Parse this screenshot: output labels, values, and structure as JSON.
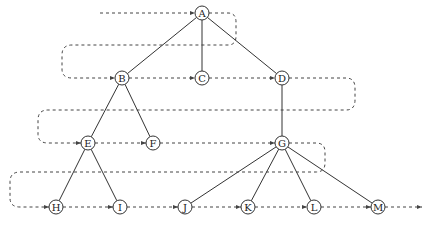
{
  "diagram": {
    "type": "tree-level-order-traversal",
    "colors": {
      "edge": "#333333",
      "path": "#444444",
      "node_stroke": "#333333",
      "node_fill": "#ffffff",
      "label": "#222222"
    },
    "node_radius": 7,
    "nodes": [
      {
        "id": "A",
        "label": "A",
        "x": 202,
        "y": 13
      },
      {
        "id": "B",
        "label": "B",
        "x": 122,
        "y": 78
      },
      {
        "id": "C",
        "label": "C",
        "x": 202,
        "y": 78
      },
      {
        "id": "D",
        "label": "D",
        "x": 282,
        "y": 78
      },
      {
        "id": "E",
        "label": "E",
        "x": 88,
        "y": 143
      },
      {
        "id": "F",
        "label": "F",
        "x": 153,
        "y": 143
      },
      {
        "id": "G",
        "label": "G",
        "x": 282,
        "y": 143
      },
      {
        "id": "H",
        "label": "H",
        "x": 56,
        "y": 207
      },
      {
        "id": "I",
        "label": "I",
        "x": 120,
        "y": 207
      },
      {
        "id": "J",
        "label": "J",
        "x": 185,
        "y": 207
      },
      {
        "id": "K",
        "label": "K",
        "x": 248,
        "y": 207
      },
      {
        "id": "L",
        "label": "L",
        "x": 314,
        "y": 207
      },
      {
        "id": "M",
        "label": "M",
        "x": 378,
        "y": 207
      }
    ],
    "edges": [
      [
        "A",
        "B"
      ],
      [
        "A",
        "C"
      ],
      [
        "A",
        "D"
      ],
      [
        "B",
        "E"
      ],
      [
        "B",
        "F"
      ],
      [
        "D",
        "G"
      ],
      [
        "E",
        "H"
      ],
      [
        "E",
        "I"
      ],
      [
        "G",
        "J"
      ],
      [
        "G",
        "K"
      ],
      [
        "G",
        "L"
      ],
      [
        "G",
        "M"
      ]
    ],
    "traversal_order": [
      "A",
      "B",
      "C",
      "D",
      "E",
      "F",
      "G",
      "H",
      "I",
      "J",
      "K",
      "L",
      "M"
    ],
    "traversal_path": "M 100 13 L 195 13 M 209 13 L 228 13 Q 236 13 236 22 L 236 36 Q 236 45 228 45 L 72 45 Q 62 45 62 55 L 62 69 Q 62 78 72 78 L 115 78 M 129 78 L 195 78 M 209 78 L 275 78 M 289 78 L 346 78 Q 355 78 355 88 L 355 100 Q 355 110 346 110 L 48 110 Q 38 110 38 120 L 38 134 Q 38 143 48 143 L 81 143 M 95 143 L 146 143 M 160 143 L 275 143 M 289 143 L 316 143 Q 325 143 325 152 L 325 163 Q 325 172 316 172 L 20 172 Q 10 172 10 182 L 10 198 Q 10 207 20 207 L 49 207 M 63 207 L 113 207 M 127 207 L 178 207 M 192 207 L 241 207 M 255 207 L 307 207 M 321 207 L 371 207 M 385 207 L 422 207",
    "arrows": [
      {
        "x": 195,
        "y": 13
      },
      {
        "x": 115,
        "y": 78
      },
      {
        "x": 195,
        "y": 78
      },
      {
        "x": 275,
        "y": 78
      },
      {
        "x": 81,
        "y": 143
      },
      {
        "x": 146,
        "y": 143
      },
      {
        "x": 275,
        "y": 143
      },
      {
        "x": 49,
        "y": 207
      },
      {
        "x": 113,
        "y": 207
      },
      {
        "x": 178,
        "y": 207
      },
      {
        "x": 241,
        "y": 207
      },
      {
        "x": 307,
        "y": 207
      },
      {
        "x": 371,
        "y": 207
      },
      {
        "x": 422,
        "y": 207
      }
    ]
  }
}
